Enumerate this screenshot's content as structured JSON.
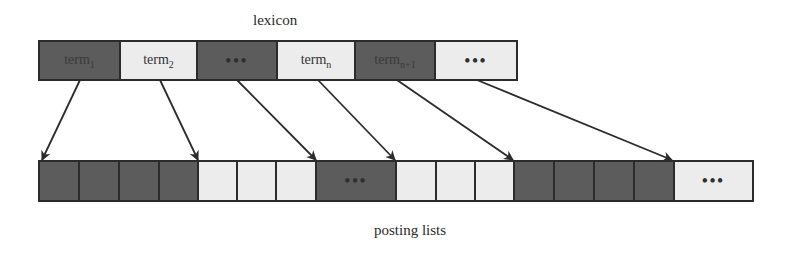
{
  "diagram": {
    "lexicon_label": "lexicon",
    "posting_label": "posting lists",
    "colors": {
      "dark": "#5c5c5c",
      "light": "#ececec",
      "border": "#2b2b2b"
    },
    "lexicon": [
      {
        "base": "term",
        "sub": "1",
        "shade": "dark",
        "width": 81
      },
      {
        "base": "term",
        "sub": "2",
        "shade": "light",
        "width": 77
      },
      {
        "base": "•••",
        "sub": "",
        "shade": "dark",
        "width": 80
      },
      {
        "base": "term",
        "sub": "n",
        "shade": "light",
        "width": 78
      },
      {
        "base": "term",
        "sub": "n+1",
        "shade": "dark",
        "width": 80
      },
      {
        "base": "•••",
        "sub": "",
        "shade": "light",
        "width": 80
      }
    ],
    "postings": [
      {
        "text": "",
        "shade": "dark",
        "width": 40
      },
      {
        "text": "",
        "shade": "dark",
        "width": 40
      },
      {
        "text": "",
        "shade": "dark",
        "width": 40
      },
      {
        "text": "",
        "shade": "dark",
        "width": 39
      },
      {
        "text": "",
        "shade": "light",
        "width": 39
      },
      {
        "text": "",
        "shade": "light",
        "width": 39
      },
      {
        "text": "",
        "shade": "light",
        "width": 40
      },
      {
        "text": "•••",
        "shade": "dark",
        "width": 80
      },
      {
        "text": "",
        "shade": "light",
        "width": 40
      },
      {
        "text": "",
        "shade": "light",
        "width": 39
      },
      {
        "text": "",
        "shade": "light",
        "width": 39
      },
      {
        "text": "",
        "shade": "dark",
        "width": 40
      },
      {
        "text": "",
        "shade": "dark",
        "width": 40
      },
      {
        "text": "",
        "shade": "dark",
        "width": 40
      },
      {
        "text": "",
        "shade": "dark",
        "width": 40
      },
      {
        "text": "•••",
        "shade": "light",
        "width": 77
      }
    ],
    "arrows": [
      {
        "from": "term1",
        "x1": 80,
        "y1": 80,
        "x2": 42,
        "y2": 160
      },
      {
        "from": "term2",
        "x1": 160,
        "y1": 80,
        "x2": 198,
        "y2": 160
      },
      {
        "from": "dots",
        "x1": 237,
        "y1": 80,
        "x2": 316,
        "y2": 160
      },
      {
        "from": "termn",
        "x1": 318,
        "y1": 80,
        "x2": 395,
        "y2": 160
      },
      {
        "from": "termn+1",
        "x1": 397,
        "y1": 80,
        "x2": 513,
        "y2": 160
      },
      {
        "from": "dots2",
        "x1": 477,
        "y1": 80,
        "x2": 672,
        "y2": 160
      }
    ]
  }
}
